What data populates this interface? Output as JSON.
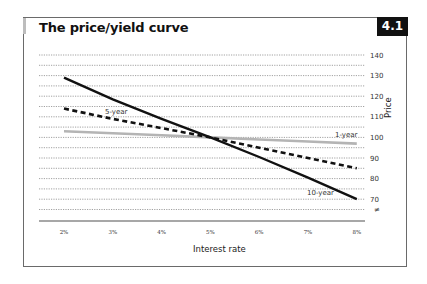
{
  "header": {
    "title": "The price/yield curve",
    "badge": "4.1"
  },
  "axes": {
    "x_title": "Interest rate",
    "y_title": "Price",
    "axis_break_symbol": "≠"
  },
  "colors": {
    "ten_year": "#111111",
    "five_year": "#111111",
    "one_year": "#b4b4b4",
    "grid": "#8a8a8a",
    "axis": "#8a8a8a"
  },
  "chart_data": {
    "type": "line",
    "title": "The price/yield curve",
    "xlabel": "Interest rate",
    "ylabel": "Price",
    "x": [
      "2%",
      "3%",
      "4%",
      "5%",
      "6%",
      "7%",
      "8%"
    ],
    "x_values": [
      2,
      3,
      4,
      5,
      6,
      7,
      8
    ],
    "ylim": [
      65,
      140
    ],
    "yticks": [
      70,
      80,
      90,
      100,
      110,
      120,
      130,
      140
    ],
    "grid": true,
    "grid_style": "dotted, every 5 units",
    "y_axis_position": "right",
    "legend": "inline labels",
    "series": [
      {
        "name": "10-year",
        "style": "solid black thick",
        "values": [
          129,
          118.5,
          109,
          100,
          90.5,
          80.5,
          70
        ]
      },
      {
        "name": "5-year",
        "style": "dashed black thick",
        "values": [
          114,
          109,
          104.5,
          100,
          95,
          90,
          85
        ]
      },
      {
        "name": "1-year",
        "style": "solid light grey thick",
        "values": [
          103,
          102,
          101,
          100,
          99,
          98,
          97
        ]
      }
    ],
    "annotations": [
      "5-year",
      "1-year",
      "10-year"
    ]
  }
}
